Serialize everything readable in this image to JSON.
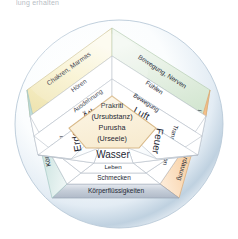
{
  "page": {
    "cut_off_line": "lung erhalten"
  },
  "colors": {
    "band_top_left": "#f7efc9",
    "band_top_right": "#dfeede",
    "band_right": "#f8cfa2",
    "band_bottom": "#c2cad6",
    "band_left": "#cbe3e0",
    "core_fill": "#fbf1dc",
    "core_stroke": "#d8b887",
    "circle_edge": "#aebfd2",
    "circle_inner": "#ffffff",
    "text": "#1d2733",
    "pentagon_stroke": "#b6bdc8"
  },
  "core": {
    "lines": [
      "Prakriti",
      "(Ursubstanz)",
      "Purusha",
      "(Urseele)"
    ]
  },
  "elements": [
    {
      "name": "Äther",
      "position": "top-left",
      "quality": "Ausdehnung",
      "sense": "Hören",
      "function": "Chakren, Marmas"
    },
    {
      "name": "Luft",
      "position": "top-right",
      "quality": "Bewegung",
      "sense": "Fühlen",
      "function": "Bewegung, Nerven"
    },
    {
      "name": "Feuer",
      "position": "right",
      "quality": "Transformation",
      "sense": "Sehen",
      "function": "Umwandlung, Verdauung"
    },
    {
      "name": "Wasser",
      "position": "bottom",
      "quality": "Leben",
      "sense": "Schmecken",
      "function": "Körperflüssigkeiten"
    },
    {
      "name": "Erde",
      "position": "left",
      "quality": "Struktur",
      "sense": "Riechen",
      "function": "Körperstruktur"
    }
  ],
  "rings": {
    "outer_label": "Funktion",
    "third_label": "Sinn",
    "second_label": "Eigenschaft",
    "inner_label": "Element",
    "core_label": "Zentrum"
  }
}
